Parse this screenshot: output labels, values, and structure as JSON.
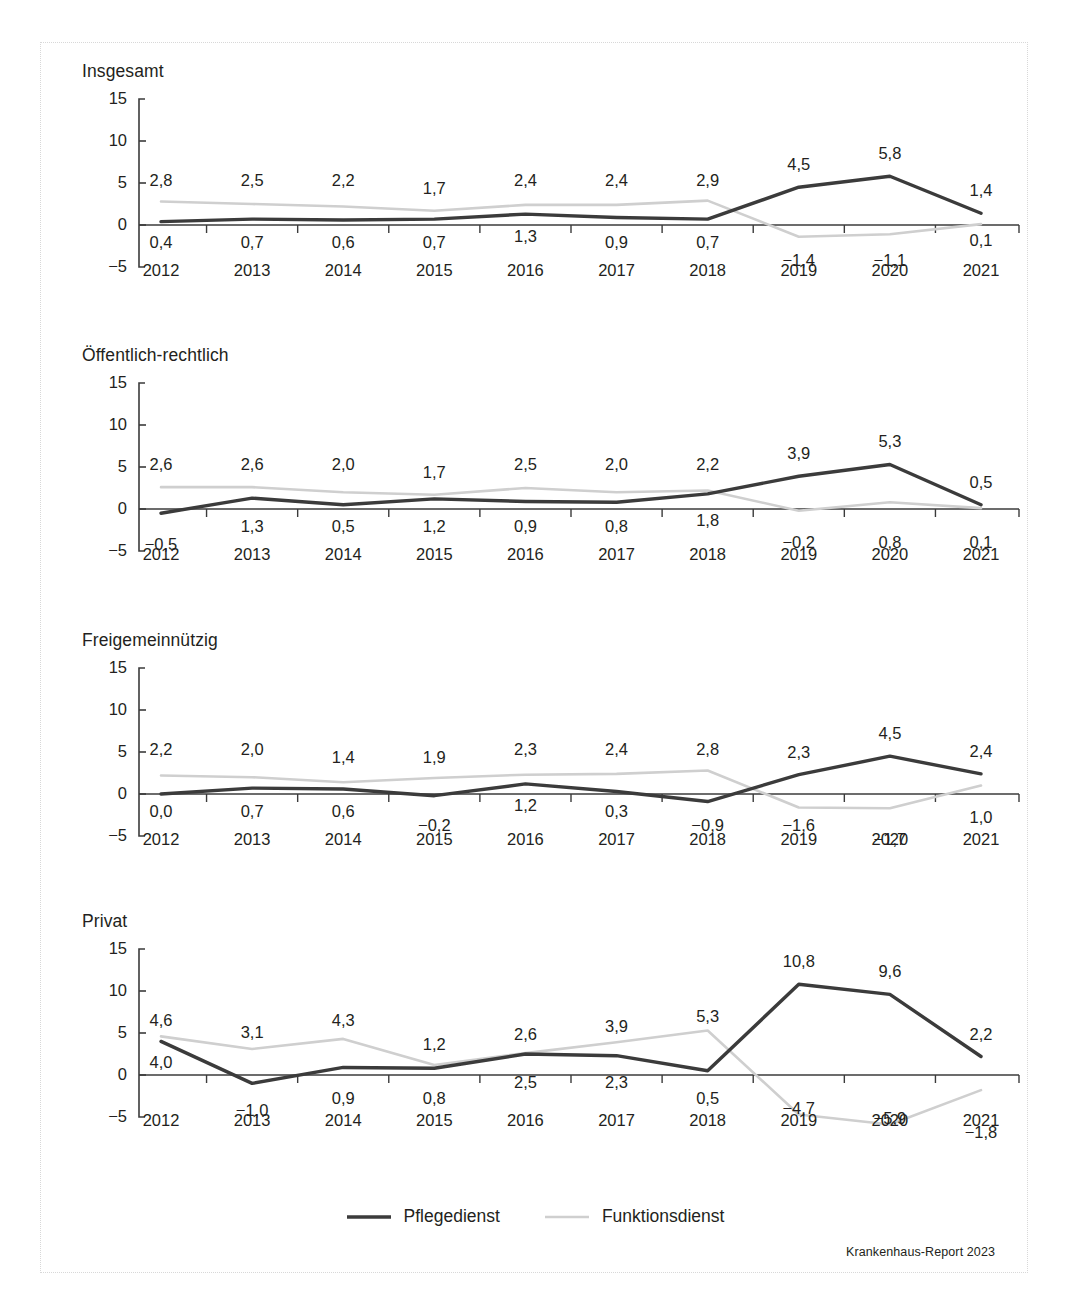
{
  "figure": {
    "source_note": "Krankenhaus-Report 2023",
    "legend": [
      {
        "label": "Pflegedienst",
        "icon": "solid-line-icon",
        "color": "#3b3b3b"
      },
      {
        "label": "Funktionsdienst",
        "icon": "light-line-icon",
        "color": "#cfcfcf"
      }
    ]
  },
  "chart_data": [
    {
      "type": "line",
      "title": "Insgesamt",
      "xlabel": "",
      "ylabel": "",
      "x": [
        "2012",
        "2013",
        "2014",
        "2015",
        "2016",
        "2017",
        "2018",
        "2019",
        "2020",
        "2021"
      ],
      "yticks": [
        "15",
        "10",
        "5",
        "0",
        "-5"
      ],
      "ylim": [
        -5,
        15
      ],
      "grid": false,
      "legend_position": "bottom",
      "series": [
        {
          "name": "Pflegedienst",
          "color": "#3b3b3b",
          "values": [
            0.4,
            0.7,
            0.6,
            0.7,
            1.3,
            0.9,
            0.7,
            4.5,
            5.8,
            1.4
          ],
          "labels": [
            "0,4",
            "0,7",
            "0,6",
            "0,7",
            "1,3",
            "0,9",
            "0,7",
            "4,5",
            "5,8",
            "1,4"
          ],
          "label_side": [
            "below",
            "below",
            "below",
            "below",
            "below",
            "below",
            "below",
            "above",
            "above",
            "above"
          ]
        },
        {
          "name": "Funktionsdienst",
          "color": "#cfcfcf",
          "values": [
            2.8,
            2.5,
            2.2,
            1.7,
            2.4,
            2.4,
            2.9,
            -1.4,
            -1.1,
            0.1
          ],
          "labels": [
            "2,8",
            "2,5",
            "2,2",
            "1,7",
            "2,4",
            "2,4",
            "2,9",
            "−1,4",
            "−1,1",
            "0,1"
          ],
          "label_side": [
            "above",
            "above",
            "above",
            "above",
            "above",
            "above",
            "above",
            "below",
            "below",
            "below"
          ]
        }
      ]
    },
    {
      "type": "line",
      "title": "Öffentlich-rechtlich",
      "xlabel": "",
      "ylabel": "",
      "x": [
        "2012",
        "2013",
        "2014",
        "2015",
        "2016",
        "2017",
        "2018",
        "2019",
        "2020",
        "2021"
      ],
      "yticks": [
        "15",
        "10",
        "5",
        "0",
        "-5"
      ],
      "ylim": [
        -5,
        15
      ],
      "grid": false,
      "legend_position": "bottom",
      "series": [
        {
          "name": "Pflegedienst",
          "color": "#3b3b3b",
          "values": [
            -0.5,
            1.3,
            0.5,
            1.2,
            0.9,
            0.8,
            1.8,
            3.9,
            5.3,
            0.5
          ],
          "labels": [
            "−0,5",
            "1,3",
            "0,5",
            "1,2",
            "0,9",
            "0,8",
            "1,8",
            "3,9",
            "5,3",
            "0,5"
          ],
          "label_side": [
            "below",
            "below",
            "below",
            "below",
            "below",
            "below",
            "below",
            "above",
            "above",
            "above"
          ]
        },
        {
          "name": "Funktionsdienst",
          "color": "#cfcfcf",
          "values": [
            2.6,
            2.6,
            2.0,
            1.7,
            2.5,
            2.0,
            2.2,
            -0.2,
            0.8,
            0.1
          ],
          "labels": [
            "2,6",
            "2,6",
            "2,0",
            "1,7",
            "2,5",
            "2,0",
            "2,2",
            "−0,2",
            "0,8",
            "0,1"
          ],
          "label_side": [
            "above",
            "above",
            "above",
            "above",
            "above",
            "above",
            "above",
            "below",
            "below",
            "below"
          ]
        }
      ]
    },
    {
      "type": "line",
      "title": "Freigemeinnützig",
      "xlabel": "",
      "ylabel": "",
      "x": [
        "2012",
        "2013",
        "2014",
        "2015",
        "2016",
        "2017",
        "2018",
        "2019",
        "2020",
        "2021"
      ],
      "yticks": [
        "15",
        "10",
        "5",
        "0",
        "-5"
      ],
      "ylim": [
        -5,
        15
      ],
      "grid": false,
      "legend_position": "bottom",
      "series": [
        {
          "name": "Pflegedienst",
          "color": "#3b3b3b",
          "values": [
            0.0,
            0.7,
            0.6,
            -0.2,
            1.2,
            0.3,
            -0.9,
            2.3,
            4.5,
            2.4
          ],
          "labels": [
            "0,0",
            "0,7",
            "0,6",
            "−0,2",
            "1,2",
            "0,3",
            "−0,9",
            "2,3",
            "4,5",
            "2,4"
          ],
          "label_side": [
            "below",
            "below",
            "below",
            "below",
            "below",
            "below",
            "below",
            "above",
            "above",
            "above"
          ]
        },
        {
          "name": "Funktionsdienst",
          "color": "#cfcfcf",
          "values": [
            2.2,
            2.0,
            1.4,
            1.9,
            2.3,
            2.4,
            2.8,
            -1.6,
            -1.7,
            1.0
          ],
          "labels": [
            "2,2",
            "2,0",
            "1,4",
            "1,9",
            "2,3",
            "2,4",
            "2,8",
            "−1,6",
            "−1,7",
            "1,0"
          ],
          "label_side": [
            "above",
            "above",
            "above",
            "above",
            "above",
            "above",
            "above",
            "below",
            "below",
            "below"
          ]
        }
      ]
    },
    {
      "type": "line",
      "title": "Privat",
      "xlabel": "",
      "ylabel": "",
      "x": [
        "2012",
        "2013",
        "2014",
        "2015",
        "2016",
        "2017",
        "2018",
        "2019",
        "2020",
        "2021"
      ],
      "yticks": [
        "15",
        "10",
        "5",
        "0",
        "-5"
      ],
      "ylim": [
        -5,
        15
      ],
      "grid": false,
      "legend_position": "bottom",
      "series": [
        {
          "name": "Pflegedienst",
          "color": "#3b3b3b",
          "values": [
            4.0,
            -1.0,
            0.9,
            0.8,
            2.5,
            2.3,
            0.5,
            10.8,
            9.6,
            2.2
          ],
          "labels": [
            "4,0",
            "−1,0",
            "0,9",
            "0,8",
            "2,5",
            "2,3",
            "0,5",
            "10,8",
            "9,6",
            "2,2"
          ],
          "label_side": [
            "below",
            "below",
            "below",
            "below",
            "below",
            "below",
            "below",
            "above",
            "above",
            "above"
          ]
        },
        {
          "name": "Funktionsdienst",
          "color": "#cfcfcf",
          "values": [
            4.6,
            3.1,
            4.3,
            1.2,
            2.6,
            3.9,
            5.3,
            -4.7,
            -5.9,
            -1.8
          ],
          "labels": [
            "4,6",
            "3,1",
            "4,3",
            "1,2",
            "2,6",
            "3,9",
            "5,3",
            "−4,7",
            "−5,9",
            "−1,8"
          ],
          "label_side": [
            "above",
            "above",
            "above",
            "above",
            "above",
            "above",
            "above",
            "below",
            "below",
            "below"
          ]
        }
      ]
    }
  ]
}
